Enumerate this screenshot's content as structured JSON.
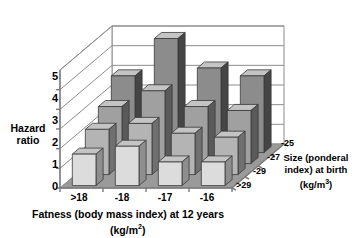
{
  "chart_data": {
    "type": "bar",
    "title": "",
    "subtitle": "",
    "projection": "3d",
    "ylabel": "Hazard ratio",
    "ylabel_line1": "Hazard",
    "ylabel_line2": "ratio",
    "xlabel": "Fatness (body mass index) at 12 years (kg/m2)",
    "xlabel_line1": "Fatness (body mass index) at 12 years",
    "xlabel_line2_pre": "(kg/m",
    "xlabel_line2_sup": "2",
    "xlabel_line2_post": ")",
    "zlabel": "Size (ponderal index) at birth (kg/m3)",
    "zlabel_line1": "Size (ponderal",
    "zlabel_line2": "index) at birth",
    "zlabel_line3_pre": "(kg/m",
    "zlabel_line3_sup": "3",
    "zlabel_line3_post": ")",
    "ylim": [
      0,
      6
    ],
    "yticks": [
      "0",
      "1",
      "2",
      "3",
      "4",
      "5"
    ],
    "ytick_values": [
      0,
      1,
      2,
      3,
      4,
      5
    ],
    "categories": [
      ">18",
      "-18",
      "-17",
      "-16"
    ],
    "depth_categories": [
      ">29",
      "-29",
      "-27",
      "-25"
    ],
    "grid": true,
    "legend": "none",
    "series": [
      {
        "name": ">29",
        "values": [
          1.6,
          2.0,
          1.2,
          1.2
        ]
      },
      {
        "name": "-29",
        "values": [
          2.3,
          2.6,
          2.1,
          1.9
        ]
      },
      {
        "name": "-27",
        "values": [
          2.9,
          3.7,
          2.9,
          2.7
        ]
      },
      {
        "name": "-25",
        "values": [
          3.9,
          5.8,
          4.3,
          3.9
        ]
      }
    ],
    "colors": {
      "front_face_row0": "#dcdcdc",
      "front_face_row1": "#b4b4b4",
      "front_face_row2": "#a0a0a0",
      "front_face_row3": "#8c8c8c",
      "side_face_row0": "#8e8e8e",
      "side_face_row1": "#707070",
      "side_face_row2": "#5a5a5a",
      "side_face_row3": "#454545",
      "top_face": "#c4c4c4",
      "floor": "#9a9a9a",
      "grid_line": "#8c8c8c",
      "background": "#ffffff",
      "axis": "#7a7a7a",
      "text": "#000000"
    }
  },
  "axes": {
    "y_ticks": [
      "0",
      "1",
      "2",
      "3",
      "4",
      "5"
    ],
    "x_ticks": [
      ">18",
      "-18",
      "-17",
      "-16"
    ],
    "z_ticks": [
      ">29",
      "-29",
      "-27",
      "-25"
    ]
  }
}
